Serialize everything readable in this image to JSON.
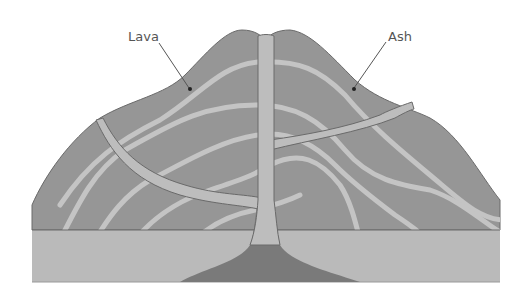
{
  "diagram": {
    "labels": {
      "lava": "Lava",
      "ash": "Ash"
    },
    "colors": {
      "mountain": "#969696",
      "layers": "#c4c4c4",
      "vent": "#bdbdbd",
      "ground": "#bababa",
      "magma": "#7a7a7a",
      "outline": "#6a6a6a",
      "leader": "#555555"
    }
  }
}
